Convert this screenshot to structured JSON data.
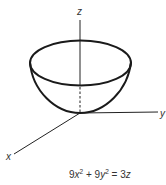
{
  "diagram": {
    "axes": {
      "x_label": "x",
      "y_label": "y",
      "z_label": "z"
    },
    "equation": {
      "text": "9x² + 9y² = 3z",
      "parts": {
        "c1": "9",
        "v1": "x",
        "e1": "2",
        "plus": " + 9",
        "v2": "y",
        "e2": "2",
        "eqsign": " = 3",
        "v3": "z"
      }
    },
    "colors": {
      "stroke": "#222222",
      "text": "#333333",
      "background": "#ffffff"
    }
  }
}
